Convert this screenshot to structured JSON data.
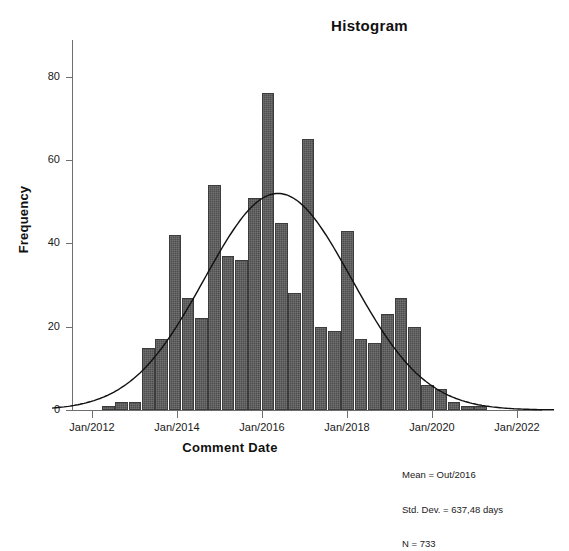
{
  "top_fragment": "  ",
  "chart": {
    "title": "Histogram",
    "xlabel": "Comment Date",
    "ylabel": "Frequency"
  },
  "stats": {
    "mean": "Mean = Out/2016",
    "std_dev": "Std. Dev. = 637,48 days",
    "n": "N = 733"
  },
  "chart_data": {
    "type": "bar",
    "title": "Histogram",
    "xlabel": "Comment Date",
    "ylabel": "Frequency",
    "ylim": [
      0,
      85
    ],
    "yticks": [
      0,
      20,
      40,
      60,
      80
    ],
    "ytick_labels": [
      "0",
      "20",
      "40",
      "60",
      "80"
    ],
    "xtick_labels": [
      "Jan/2012",
      "Jan/2014",
      "Jan/2016",
      "Jan/2018",
      "Jan/2020",
      "Jan/2022"
    ],
    "grid": false,
    "legend": false,
    "bar_color": "#4e4e4e",
    "curve_color": "#111111",
    "overlay": "normal-curve",
    "categories": [
      "b01",
      "b02",
      "b03",
      "b04",
      "b05",
      "b06",
      "b07",
      "b08",
      "b09",
      "b10",
      "b11",
      "b12",
      "b13",
      "b14",
      "b15",
      "b16",
      "b17",
      "b18",
      "b19",
      "b20",
      "b21",
      "b22",
      "b23",
      "b24",
      "b25",
      "b26",
      "b27",
      "b28",
      "b29",
      "b30",
      "b31",
      "b32",
      "b33"
    ],
    "values": [
      1,
      2,
      2,
      15,
      17,
      42,
      27,
      22,
      54,
      37,
      36,
      51,
      76,
      45,
      28,
      65,
      20,
      19,
      43,
      17,
      16,
      23,
      27,
      20,
      6,
      5,
      2,
      1,
      1,
      0,
      0,
      0,
      0
    ],
    "notes": [
      "Mean = Out/2016",
      "Std. Dev. = 637,48 days",
      "N = 733"
    ]
  }
}
